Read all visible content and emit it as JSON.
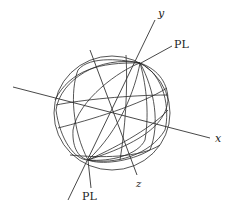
{
  "diagram": {
    "type": "3d-curves-on-sphere",
    "axes": [
      {
        "name": "x",
        "label": "x"
      },
      {
        "name": "y",
        "label": "y"
      },
      {
        "name": "z",
        "label": "z"
      }
    ],
    "annotations": [
      {
        "id": "pl-top",
        "label": "PL"
      },
      {
        "id": "pl-bottom",
        "label": "PL"
      }
    ],
    "colors": {
      "stroke": "#2a2a2a",
      "background": "#ffffff"
    }
  }
}
